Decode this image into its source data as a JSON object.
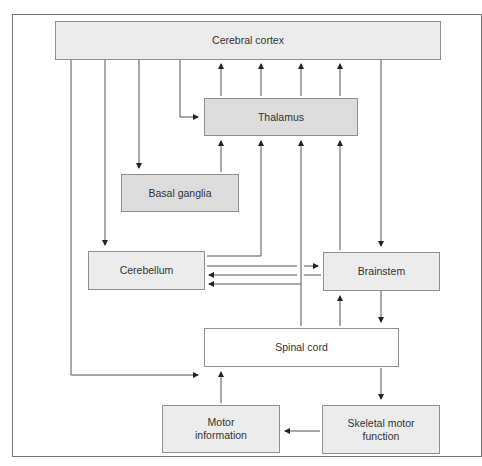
{
  "diagram": {
    "type": "flowchart",
    "title": "",
    "nodes": [
      {
        "id": "cortex",
        "label": "Cerebral cortex"
      },
      {
        "id": "thalamus",
        "label": "Thalamus"
      },
      {
        "id": "basal",
        "label": "Basal ganglia"
      },
      {
        "id": "cerebellum",
        "label": "Cerebellum"
      },
      {
        "id": "brainstem",
        "label": "Brainstem"
      },
      {
        "id": "spinal",
        "label": "Spinal cord"
      },
      {
        "id": "motorinfo",
        "label": "Motor\ninformation"
      },
      {
        "id": "skeletal",
        "label": "Skeletal motor\nfunction"
      }
    ],
    "edges": [
      {
        "from": "cortex",
        "to": "thalamus"
      },
      {
        "from": "thalamus",
        "to": "cortex",
        "count": 4
      },
      {
        "from": "cortex",
        "to": "basal"
      },
      {
        "from": "basal",
        "to": "thalamus"
      },
      {
        "from": "cortex",
        "to": "cerebellum"
      },
      {
        "from": "cerebellum",
        "to": "thalamus"
      },
      {
        "from": "cortex",
        "to": "brainstem"
      },
      {
        "from": "cortex",
        "to": "spinal"
      },
      {
        "from": "cerebellum",
        "to": "brainstem"
      },
      {
        "from": "brainstem",
        "to": "cerebellum"
      },
      {
        "from": "spinal",
        "to": "cerebellum"
      },
      {
        "from": "brainstem",
        "to": "thalamus"
      },
      {
        "from": "spinal",
        "to": "thalamus"
      },
      {
        "from": "spinal",
        "to": "brainstem"
      },
      {
        "from": "brainstem",
        "to": "spinal"
      },
      {
        "from": "spinal",
        "to": "skeletal"
      },
      {
        "from": "skeletal",
        "to": "motorinfo"
      },
      {
        "from": "motorinfo",
        "to": "spinal"
      }
    ]
  },
  "labels": {
    "cortex": "Cerebral cortex",
    "thalamus": "Thalamus",
    "basal": "Basal ganglia",
    "cerebellum": "Cerebellum",
    "brainstem": "Brainstem",
    "spinal": "Spinal cord",
    "motorinfo_1": "Motor",
    "motorinfo_2": "information",
    "skeletal_1": "Skeletal motor",
    "skeletal_2": "function"
  }
}
